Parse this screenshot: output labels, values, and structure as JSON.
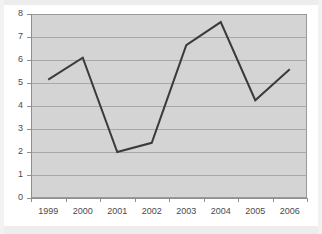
{
  "chart_data": {
    "type": "line",
    "title": "",
    "xlabel": "",
    "ylabel": "",
    "categories": [
      "1999",
      "2000",
      "2001",
      "2002",
      "2003",
      "2004",
      "2005",
      "2006"
    ],
    "values": [
      5.15,
      6.1,
      2.0,
      2.4,
      6.65,
      7.65,
      4.25,
      5.6
    ],
    "series": [
      {
        "name": "Series 1",
        "values": [
          5.15,
          6.1,
          2.0,
          2.4,
          6.65,
          7.65,
          4.25,
          5.6
        ]
      }
    ],
    "ylim": [
      0,
      8
    ],
    "ytick_labels": [
      "0",
      "1",
      "2",
      "3",
      "4",
      "5",
      "6",
      "7",
      "8"
    ],
    "ytick_values": [
      0,
      1,
      2,
      3,
      4,
      5,
      6,
      7,
      8
    ],
    "xtick_labels": [
      "1999",
      "2000",
      "2001",
      "2002",
      "2003",
      "2004",
      "2005",
      "2006"
    ],
    "grid": true,
    "grid_axis": "y",
    "legend": false,
    "legend_position": "none",
    "markers": false,
    "annotations": []
  },
  "style": {
    "page_background": "#ffffff",
    "plot_background": "#d4d4d4",
    "line_color": "#3a3a3a",
    "gridline_color": "#a8a8a8",
    "axis_color": "#8e8e8e",
    "tick_label_color": "#4a4a4a",
    "band_color": "#ededed"
  }
}
